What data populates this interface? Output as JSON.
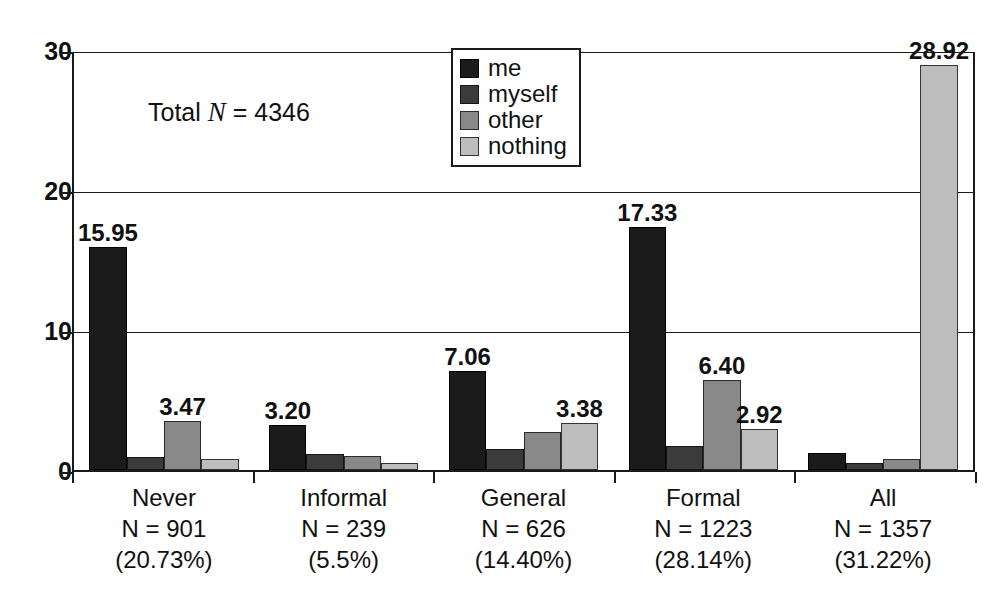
{
  "chart_data": {
    "type": "bar",
    "title": "",
    "subtitle": "",
    "xlabel": "",
    "ylabel": "",
    "ylim": [
      0,
      30
    ],
    "yticks": [
      0,
      10,
      20,
      30
    ],
    "ytick_labels": [
      "0",
      "10",
      "20",
      "30"
    ],
    "grid": true,
    "grid_axis": "y",
    "legend_position": "top-center",
    "annotation": {
      "prefix": "Total ",
      "italic": "N",
      "suffix": " = 4346",
      "full_text": "Total N = 4346"
    },
    "categories": [
      "Never",
      "Informal",
      "General",
      "Formal",
      "All"
    ],
    "category_n": [
      "N = 901",
      "N = 239",
      "N = 626",
      "N = 1223",
      "N = 1357"
    ],
    "category_pct": [
      "(20.73%)",
      "(5.5%)",
      "(14.40%)",
      "(28.14%)",
      "(31.22%)"
    ],
    "series": [
      {
        "name": "me",
        "color": "#1b1b1b",
        "values": [
          15.95,
          3.2,
          7.06,
          17.33,
          1.2
        ],
        "labels": [
          "15.95",
          "3.20",
          "7.06",
          "17.33",
          ""
        ]
      },
      {
        "name": "myself",
        "color": "#3b3b3b",
        "values": [
          0.9,
          1.15,
          1.5,
          1.7,
          0.5
        ],
        "labels": [
          "",
          "",
          "",
          "",
          ""
        ]
      },
      {
        "name": "other",
        "color": "#898989",
        "values": [
          3.47,
          1.0,
          2.7,
          6.4,
          0.8
        ],
        "labels": [
          "3.47",
          "",
          "",
          "6.40",
          ""
        ]
      },
      {
        "name": "nothing",
        "color": "#bdbdbd",
        "values": [
          0.8,
          0.5,
          3.38,
          2.92,
          28.92
        ],
        "labels": [
          "",
          "",
          "3.38",
          "2.92",
          "28.92"
        ]
      }
    ]
  },
  "legend": {
    "items": [
      {
        "label": "me"
      },
      {
        "label": "myself"
      },
      {
        "label": "other"
      },
      {
        "label": "nothing"
      }
    ]
  }
}
